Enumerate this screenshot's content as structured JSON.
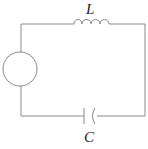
{
  "diagram": {
    "type": "LC circuit",
    "components": [
      {
        "id": "source",
        "kind": "AC source",
        "symbol": "circle"
      },
      {
        "id": "inductor",
        "kind": "inductor",
        "label": "L"
      },
      {
        "id": "capacitor",
        "kind": "capacitor",
        "label": "C"
      }
    ],
    "labels": {
      "inductor": "L",
      "capacitor": "C"
    },
    "colors": {
      "wire": "#8a8a8a",
      "background": "#ffffff",
      "text": "#222222"
    }
  }
}
